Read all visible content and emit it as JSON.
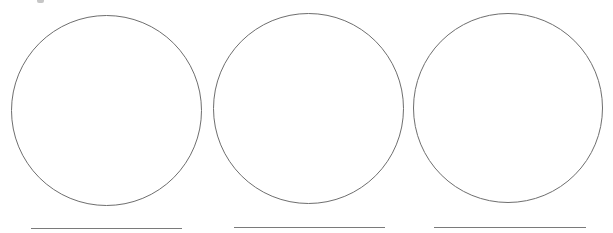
{
  "canvas": {
    "width": 613,
    "height": 233,
    "background": "#ffffff"
  },
  "stroke_color": "#6e6e6e",
  "line_color": "#7a7a7a",
  "items": [
    {
      "circle": {
        "left": 11,
        "top": 15,
        "size": 191
      },
      "answer_line": {
        "left": 31,
        "top": 228,
        "width": 151
      }
    },
    {
      "circle": {
        "left": 213,
        "top": 13,
        "size": 191
      },
      "answer_line": {
        "left": 234,
        "top": 227,
        "width": 151
      }
    },
    {
      "circle": {
        "left": 413,
        "top": 13,
        "size": 190
      },
      "answer_line": {
        "left": 434,
        "top": 227,
        "width": 152
      }
    }
  ]
}
